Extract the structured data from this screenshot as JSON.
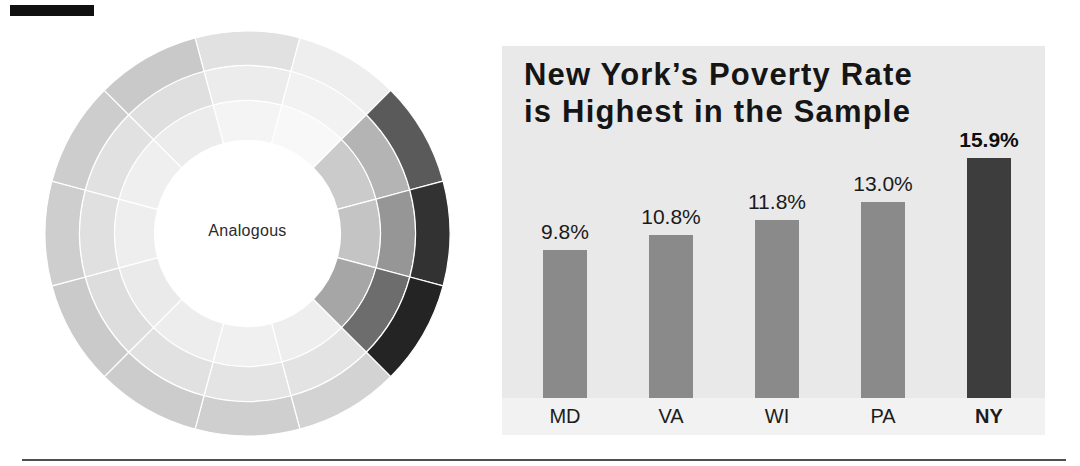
{
  "page": {
    "background": "#ffffff",
    "crop_mark_color": "#101010",
    "bottom_rule_color": "#4f4f4f"
  },
  "chart_data": [
    {
      "type": "donut",
      "title": "",
      "label": "Analogous",
      "label_color": "#2b2b2b",
      "divider_color": "#ffffff",
      "rings": [
        "inner",
        "middle",
        "outer"
      ],
      "highlighted_clock_positions": [
        2,
        3,
        4
      ],
      "sectors": [
        {
          "clock": 12,
          "inner": "#f4f4f4",
          "middle": "#ececec",
          "outer": "#e1e1e1"
        },
        {
          "clock": 1,
          "inner": "#f8f8f8",
          "middle": "#f2f2f2",
          "outer": "#eeeeee"
        },
        {
          "clock": 2,
          "inner": "#cbcbcb",
          "middle": "#b4b4b4",
          "outer": "#5a5a5a"
        },
        {
          "clock": 3,
          "inner": "#c4c4c4",
          "middle": "#969696",
          "outer": "#323232"
        },
        {
          "clock": 4,
          "inner": "#a6a6a6",
          "middle": "#6d6d6d",
          "outer": "#242424"
        },
        {
          "clock": 5,
          "inner": "#eeeeee",
          "middle": "#e3e3e3",
          "outer": "#d3d3d3"
        },
        {
          "clock": 6,
          "inner": "#f0f0f0",
          "middle": "#e4e4e4",
          "outer": "#cfcfcf"
        },
        {
          "clock": 7,
          "inner": "#ededed",
          "middle": "#e1e1e1",
          "outer": "#cccccc"
        },
        {
          "clock": 8,
          "inner": "#eaeaea",
          "middle": "#dddddd",
          "outer": "#cacaca"
        },
        {
          "clock": 9,
          "inner": "#eeeeee",
          "middle": "#e0e0e0",
          "outer": "#cecece"
        },
        {
          "clock": 10,
          "inner": "#efefef",
          "middle": "#e1e1e1",
          "outer": "#cdcdcd"
        },
        {
          "clock": 11,
          "inner": "#ececec",
          "middle": "#dfdfdf",
          "outer": "#c9c9c9"
        }
      ]
    },
    {
      "type": "bar",
      "title": "New York’s Poverty Rate is Highest in the Sample",
      "title_lines": [
        "New York’s Poverty Rate",
        "is Highest in the Sample"
      ],
      "categories": [
        "MD",
        "VA",
        "WI",
        "PA",
        "NY"
      ],
      "values": [
        9.8,
        10.8,
        11.8,
        13.0,
        15.9
      ],
      "value_labels": [
        "9.8%",
        "10.8%",
        "11.8%",
        "13.0%",
        "15.9%"
      ],
      "emphasized_category": "NY",
      "bar_color": "#8a8a8a",
      "emphasis_color": "#3d3d3d",
      "background": "#e9e9e9",
      "label_strip_color": "#f2f2f2",
      "xlabel": "",
      "ylabel": "",
      "ylim": [
        0,
        18
      ],
      "grid": false,
      "legend": false
    }
  ]
}
